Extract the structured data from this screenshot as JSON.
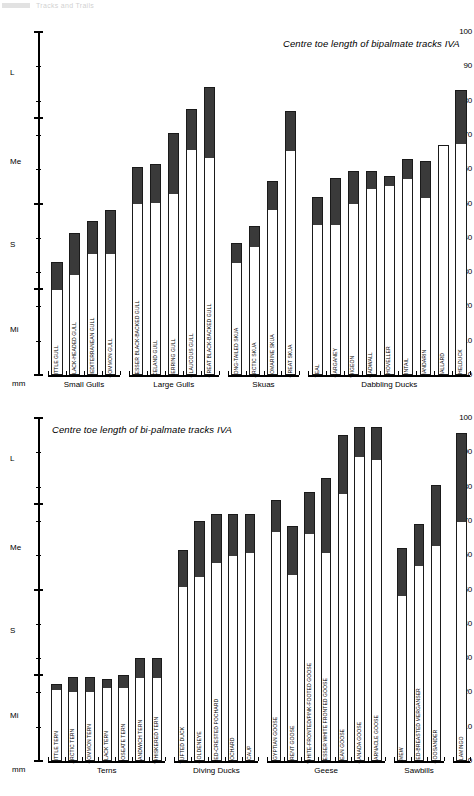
{
  "page": {
    "header_text": "Tracks and Trails"
  },
  "axis": {
    "ticks": [
      0,
      10,
      20,
      30,
      40,
      50,
      60,
      70,
      80,
      90,
      100
    ],
    "major_ticks": [
      0,
      25,
      50,
      75,
      100
    ],
    "unit_label": "mm",
    "size_labels": [
      {
        "text": "L",
        "value": 88
      },
      {
        "text": "Me",
        "value": 62
      },
      {
        "text": "S",
        "value": 38
      },
      {
        "text": "Mi",
        "value": 13
      }
    ],
    "min": 0,
    "max": 100
  },
  "colors": {
    "bar_fill_dark": "#3a3a3a",
    "bar_fill_light": "#ffffff",
    "bar_outline": "#1a1a1a",
    "axis": "#000000",
    "background": "#ffffff"
  },
  "chart_data": [
    {
      "type": "bar",
      "id": "bipalmate",
      "title": "Centre toe length of bipalmate tracks IVA",
      "ylabel": "mm",
      "ylim": [
        0,
        100
      ],
      "grid": false,
      "legend": "none",
      "groups": [
        {
          "name": "Small Gulls",
          "categories": [
            "LITTLE GULL",
            "BLACK-HEADED GULL",
            "MEDITERRANEAN GULL",
            "COMMON GULL"
          ],
          "range_min": [
            25.0,
            29.5,
            35.5,
            35.5
          ],
          "range_max": [
            33.0,
            41.5,
            45.0,
            48.0
          ]
        },
        {
          "name": "Large Gulls",
          "categories": [
            "LESSER BLACK-BACKED GULL",
            "ICELAND GULL",
            "HERRING GULL",
            "GLAUCOUS GULL",
            "GREAT BLACK-BACKED GULL"
          ],
          "range_min": [
            50.0,
            50.5,
            53.0,
            66.0,
            63.5
          ],
          "range_max": [
            60.5,
            61.5,
            70.5,
            77.5,
            84.0
          ]
        },
        {
          "name": "Skuas",
          "categories": [
            "LONG-TAILED SKUA",
            "ARCTIC SKUA",
            "POMARINE SKUA",
            "GREAT SKUA"
          ],
          "range_min": [
            33.0,
            37.5,
            48.5,
            65.5
          ],
          "range_max": [
            38.5,
            43.5,
            56.5,
            77.0
          ]
        },
        {
          "name": "Dabbling Ducks",
          "categories": [
            "TEAL",
            "GARGANEY",
            "WIGEON",
            "GADWALL",
            "SHOVELLER",
            "PINTAIL",
            "MANDARIN",
            "MALLARD",
            "SHELDUCK"
          ],
          "range_min": [
            44.0,
            44.0,
            50.0,
            54.5,
            55.5,
            57.5,
            52.0,
            67.0,
            67.5
          ],
          "range_max": [
            52.0,
            57.5,
            59.5,
            59.5,
            58.0,
            63.0,
            62.5,
            67.0,
            83.0
          ]
        }
      ]
    },
    {
      "type": "bar",
      "id": "bi-palmate",
      "title": "Centre toe length of bi-palmate tracks IVA",
      "ylabel": "mm",
      "ylim": [
        0,
        100
      ],
      "grid": false,
      "legend": "none",
      "groups": [
        {
          "name": "Terns",
          "categories": [
            "LITTLE TERN",
            "ARCTIC TERN",
            "COMMON TERN",
            "BLACK TERN",
            "ROSEATE TERN",
            "SANDWICH TERN",
            "WHISKERED TERN"
          ],
          "range_min": [
            21.0,
            20.5,
            20.5,
            21.5,
            21.5,
            24.5,
            24.5
          ],
          "range_max": [
            22.5,
            24.5,
            24.5,
            24.0,
            25.0,
            30.0,
            30.0
          ]
        },
        {
          "name": "Diving Ducks",
          "categories": [
            "TUFTED DUCK",
            "GOLDENEYE",
            "RED-CRESTED POCHARD",
            "POCHARD",
            "SCAUP"
          ],
          "range_min": [
            51.0,
            54.0,
            58.0,
            60.0,
            61.0
          ],
          "range_max": [
            61.5,
            70.0,
            72.0,
            72.0,
            72.0
          ]
        },
        {
          "name": "Geese",
          "categories": [
            "EGYPTIAN GOOSE",
            "BRENT GOOSE",
            "WHITE-FRONTED/PINK-FOOTED GOOSE",
            "LESSER WHITE FRONTED GOOSE",
            "BEAN GOOSE",
            "CANADA GOOSE",
            "BARNACLE GOOSE"
          ],
          "range_min": [
            67.0,
            54.5,
            66.5,
            61.0,
            78.0,
            89.0,
            88.0
          ],
          "range_max": [
            76.0,
            68.5,
            78.5,
            82.5,
            95.0,
            97.5,
            97.5
          ]
        },
        {
          "name": "Sawbills",
          "categories": [
            "SMEW",
            "RED-BREASTED MERGANSER",
            "GOOSANDER"
          ],
          "range_min": [
            48.5,
            57.0,
            63.0
          ],
          "range_max": [
            62.0,
            69.0,
            80.5
          ]
        },
        {
          "name": "",
          "categories": [
            "FLAMINGO"
          ],
          "range_min": [
            70.0
          ],
          "range_max": [
            95.5
          ]
        }
      ]
    }
  ]
}
